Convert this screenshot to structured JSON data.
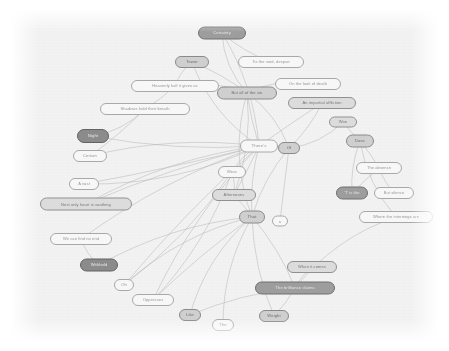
{
  "graph": {
    "type": "node-link-graph",
    "title": "",
    "canvas": {
      "background_color": "#f2f2f2",
      "page_background_color": "#ffffff",
      "width": 425,
      "height": 331
    },
    "edge_color": "#b4b4b4",
    "node_shape": "rounded-pill",
    "node_count": 34,
    "edge_count": 54,
    "nodes": [
      {
        "id": "n01",
        "label": "Certainty",
        "x": 210,
        "y": 23,
        "w": 48,
        "h": 13,
        "shade": "sh-dark",
        "fs": 4.2
      },
      {
        "id": "n02",
        "label": "Tis the void, despair",
        "x": 259,
        "y": 52,
        "w": 66,
        "h": 12,
        "shade": "sh-light",
        "fs": 4.0
      },
      {
        "id": "n03",
        "label": "Tower",
        "x": 180,
        "y": 52,
        "w": 34,
        "h": 12,
        "shade": "sh-mid2",
        "fs": 4.2
      },
      {
        "id": "n04",
        "label": "Heavenly hall it gives us",
        "x": 163,
        "y": 76,
        "w": 88,
        "h": 12,
        "shade": "sh-light",
        "fs": 4.0
      },
      {
        "id": "n05",
        "label": "But all of the sin",
        "x": 235,
        "y": 83,
        "w": 60,
        "h": 13,
        "shade": "sh-mid2",
        "fs": 4.1
      },
      {
        "id": "n06",
        "label": "On the look of death",
        "x": 296,
        "y": 74,
        "w": 66,
        "h": 12,
        "shade": "sh-light",
        "fs": 4.0
      },
      {
        "id": "n07",
        "label": "An impartial affliction",
        "x": 310,
        "y": 93,
        "w": 68,
        "h": 12,
        "shade": "sh-mid",
        "fs": 4.0
      },
      {
        "id": "n08",
        "label": "Shadows hold their breath",
        "x": 133,
        "y": 99,
        "w": 90,
        "h": 12,
        "shade": "sh-light",
        "fs": 4.0
      },
      {
        "id": "n09",
        "label": "Night",
        "x": 81,
        "y": 126,
        "w": 32,
        "h": 14,
        "shade": "sh-darker",
        "fs": 4.2
      },
      {
        "id": "n10",
        "label": "Won",
        "x": 331,
        "y": 112,
        "w": 28,
        "h": 11,
        "shade": "sh-mid",
        "fs": 4.1
      },
      {
        "id": "n11",
        "label": "There's",
        "x": 247,
        "y": 136,
        "w": 38,
        "h": 13,
        "shade": "sh-light",
        "fs": 4.4
      },
      {
        "id": "n12",
        "label": "Of",
        "x": 277,
        "y": 138,
        "w": 22,
        "h": 12,
        "shade": "sh-mid2",
        "fs": 4.2
      },
      {
        "id": "n13",
        "label": "Does",
        "x": 348,
        "y": 131,
        "w": 28,
        "h": 13,
        "shade": "sh-mid2",
        "fs": 4.1
      },
      {
        "id": "n14",
        "label": "Certain",
        "x": 78,
        "y": 146,
        "w": 34,
        "h": 12,
        "shade": "sh-light",
        "fs": 4.1
      },
      {
        "id": "n15",
        "label": "The absence",
        "x": 367,
        "y": 158,
        "w": 46,
        "h": 12,
        "shade": "sh-light",
        "fs": 4.0
      },
      {
        "id": "n16",
        "label": "Wear",
        "x": 220,
        "y": 162,
        "w": 28,
        "h": 12,
        "shade": "sh-light",
        "fs": 4.1
      },
      {
        "id": "n17",
        "label": "A vast",
        "x": 72,
        "y": 174,
        "w": 30,
        "h": 12,
        "shade": "sh-light",
        "fs": 4.1
      },
      {
        "id": "n18",
        "label": "'T is the",
        "x": 340,
        "y": 183,
        "w": 32,
        "h": 13,
        "shade": "sh-dark",
        "fs": 4.1
      },
      {
        "id": "n19",
        "label": "But silence",
        "x": 382,
        "y": 183,
        "w": 40,
        "h": 12,
        "shade": "sh-light",
        "fs": 4.0
      },
      {
        "id": "n20",
        "label": "Afternoons",
        "x": 222,
        "y": 185,
        "w": 44,
        "h": 12,
        "shade": "sh-mid",
        "fs": 4.1
      },
      {
        "id": "n21",
        "label": "Nest only heart is soothing",
        "x": 74,
        "y": 194,
        "w": 92,
        "h": 13,
        "shade": "sh-mid",
        "fs": 4.0
      },
      {
        "id": "n22",
        "label": "Where the internings are",
        "x": 384,
        "y": 207,
        "w": 74,
        "h": 12,
        "shade": "sh-light",
        "fs": 4.0
      },
      {
        "id": "n23",
        "label": "That",
        "x": 240,
        "y": 207,
        "w": 26,
        "h": 13,
        "shade": "sh-mid2",
        "fs": 4.2
      },
      {
        "id": "n24",
        "label": "a",
        "x": 268,
        "y": 211,
        "w": 16,
        "h": 11,
        "shade": "sh-light",
        "fs": 4.0
      },
      {
        "id": "n25",
        "label": "We can find no end",
        "x": 69,
        "y": 229,
        "w": 62,
        "h": 12,
        "shade": "sh-light",
        "fs": 4.0
      },
      {
        "id": "n26",
        "label": "Withhold",
        "x": 87,
        "y": 255,
        "w": 38,
        "h": 13,
        "shade": "sh-darker",
        "fs": 4.1
      },
      {
        "id": "n27",
        "label": "When it comes",
        "x": 300,
        "y": 257,
        "w": 50,
        "h": 12,
        "shade": "sh-mid",
        "fs": 4.0
      },
      {
        "id": "n28",
        "label": "The brilliance claims",
        "x": 283,
        "y": 278,
        "w": 80,
        "h": 13,
        "shade": "sh-dark",
        "fs": 4.1
      },
      {
        "id": "n29",
        "label": "Oh",
        "x": 112,
        "y": 275,
        "w": 20,
        "h": 12,
        "shade": "sh-light",
        "fs": 4.1
      },
      {
        "id": "n30",
        "label": "Oppresses",
        "x": 141,
        "y": 290,
        "w": 42,
        "h": 12,
        "shade": "sh-light",
        "fs": 4.1
      },
      {
        "id": "n31",
        "label": "Like",
        "x": 178,
        "y": 305,
        "w": 22,
        "h": 12,
        "shade": "sh-mid2",
        "fs": 4.1
      },
      {
        "id": "n32",
        "label": "The",
        "x": 211,
        "y": 315,
        "w": 22,
        "h": 12,
        "shade": "sh-light",
        "fs": 4.1
      },
      {
        "id": "n33",
        "label": "Weight",
        "x": 262,
        "y": 306,
        "w": 30,
        "h": 12,
        "shade": "sh-mid2",
        "fs": 4.1
      }
    ],
    "edges": [
      {
        "from": "n01",
        "to": "n02"
      },
      {
        "from": "n01",
        "to": "n05"
      },
      {
        "from": "n01",
        "to": "n11"
      },
      {
        "from": "n03",
        "to": "n05"
      },
      {
        "from": "n03",
        "to": "n04"
      },
      {
        "from": "n03",
        "to": "n11"
      },
      {
        "from": "n04",
        "to": "n08"
      },
      {
        "from": "n04",
        "to": "n05"
      },
      {
        "from": "n05",
        "to": "n11"
      },
      {
        "from": "n05",
        "to": "n12"
      },
      {
        "from": "n05",
        "to": "n23"
      },
      {
        "from": "n05",
        "to": "n20"
      },
      {
        "from": "n06",
        "to": "n05"
      },
      {
        "from": "n07",
        "to": "n12"
      },
      {
        "from": "n07",
        "to": "n11"
      },
      {
        "from": "n08",
        "to": "n09"
      },
      {
        "from": "n08",
        "to": "n14"
      },
      {
        "from": "n09",
        "to": "n11"
      },
      {
        "from": "n10",
        "to": "n12"
      },
      {
        "from": "n10",
        "to": "n13"
      },
      {
        "from": "n11",
        "to": "n12"
      },
      {
        "from": "n11",
        "to": "n14"
      },
      {
        "from": "n11",
        "to": "n17"
      },
      {
        "from": "n11",
        "to": "n21"
      },
      {
        "from": "n11",
        "to": "n25"
      },
      {
        "from": "n11",
        "to": "n16"
      },
      {
        "from": "n11",
        "to": "n20"
      },
      {
        "from": "n11",
        "to": "n23"
      },
      {
        "from": "n11",
        "to": "n29"
      },
      {
        "from": "n11",
        "to": "n30"
      },
      {
        "from": "n12",
        "to": "n23"
      },
      {
        "from": "n12",
        "to": "n24"
      },
      {
        "from": "n13",
        "to": "n15"
      },
      {
        "from": "n13",
        "to": "n18"
      },
      {
        "from": "n13",
        "to": "n22"
      },
      {
        "from": "n15",
        "to": "n18"
      },
      {
        "from": "n15",
        "to": "n19"
      },
      {
        "from": "n16",
        "to": "n20"
      },
      {
        "from": "n16",
        "to": "n29"
      },
      {
        "from": "n16",
        "to": "n30"
      },
      {
        "from": "n17",
        "to": "n11"
      },
      {
        "from": "n20",
        "to": "n23"
      },
      {
        "from": "n21",
        "to": "n11"
      },
      {
        "from": "n22",
        "to": "n28"
      },
      {
        "from": "n23",
        "to": "n26"
      },
      {
        "from": "n23",
        "to": "n29"
      },
      {
        "from": "n23",
        "to": "n30"
      },
      {
        "from": "n23",
        "to": "n31"
      },
      {
        "from": "n23",
        "to": "n32"
      },
      {
        "from": "n23",
        "to": "n33"
      },
      {
        "from": "n23",
        "to": "n28"
      },
      {
        "from": "n25",
        "to": "n26"
      },
      {
        "from": "n27",
        "to": "n28"
      },
      {
        "from": "n28",
        "to": "n31"
      },
      {
        "from": "n28",
        "to": "n33"
      }
    ]
  }
}
